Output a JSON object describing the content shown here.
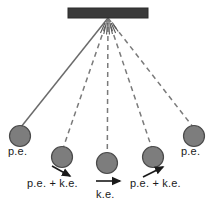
{
  "figure": {
    "colors": {
      "support_bar": "#3a3a3a",
      "bob_fill": "#7d7d7d",
      "bob_stroke": "#4a4a4a",
      "string_solid": "#6b6b6b",
      "string_dashed": "#7a7a7a",
      "arrow": "#1a1a1a",
      "text": "#1a1a1a",
      "background": "#ffffff"
    },
    "support_bar": {
      "x": 68,
      "y": 8,
      "width": 80,
      "height": 10
    },
    "pivot": {
      "x": 108,
      "y": 18
    }
  },
  "labels": {
    "pe_left": "p.e.",
    "pe_right": "p.e.",
    "pe_ke_left": "p.e. + k.e.",
    "ke_center": "k.e.",
    "pe_ke_right": "p.e. + k.e."
  },
  "bobs": [
    {
      "name": "bob-far-left",
      "cx": 20,
      "cy": 136,
      "r": 10.5,
      "string": "solid"
    },
    {
      "name": "bob-mid-left",
      "cx": 62,
      "cy": 157,
      "r": 10.5,
      "string": "dashed"
    },
    {
      "name": "bob-center",
      "cx": 107,
      "cy": 163,
      "r": 10.5,
      "string": "dashed"
    },
    {
      "name": "bob-mid-right",
      "cx": 153,
      "cy": 157,
      "r": 10.5,
      "string": "dashed"
    },
    {
      "name": "bob-far-right",
      "cx": 194,
      "cy": 136,
      "r": 10.5,
      "string": "dashed"
    }
  ],
  "arrows": [
    {
      "name": "arrow-left-downward",
      "x1": 52,
      "y1": 166,
      "x2": 71,
      "y2": 177,
      "direction": "down-right"
    },
    {
      "name": "arrow-center-right",
      "x1": 96,
      "y1": 181,
      "x2": 121,
      "y2": 181,
      "direction": "right"
    },
    {
      "name": "arrow-right-upward",
      "x1": 143,
      "y1": 177,
      "x2": 164,
      "y2": 167,
      "direction": "up-right"
    }
  ],
  "pivot_fan": {
    "description": "short radial dash marks fanning below the pivot",
    "count": 7
  }
}
